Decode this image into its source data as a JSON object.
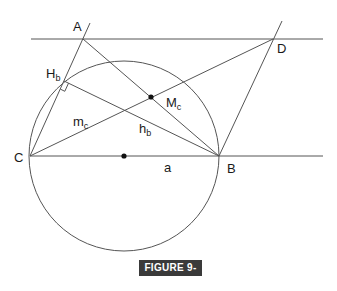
{
  "figure": {
    "caption": "FIGURE 9-13",
    "colors": {
      "line": "#555555",
      "point": "#111111",
      "caption_bg": "#3a3a3a",
      "caption_text": "#ffffff"
    },
    "points": {
      "A": {
        "label": "A",
        "x": 83,
        "y": 39
      },
      "B": {
        "label": "B",
        "x": 219,
        "y": 156
      },
      "C": {
        "label": "C",
        "x": 30,
        "y": 156
      },
      "D": {
        "label": "D",
        "x": 273,
        "y": 39
      },
      "Hb": {
        "label": "H",
        "sub": "b",
        "x": 64,
        "y": 81
      },
      "Mc": {
        "label": "M",
        "sub": "c",
        "x": 151,
        "y": 97
      },
      "O": {
        "x": 124,
        "y": 156
      }
    },
    "segment_labels": {
      "a": "a",
      "mc": {
        "main": "m",
        "sub": "c"
      },
      "hb": {
        "main": "h",
        "sub": "b"
      }
    },
    "circle": {
      "cx": 124,
      "cy": 156,
      "r": 95
    }
  }
}
